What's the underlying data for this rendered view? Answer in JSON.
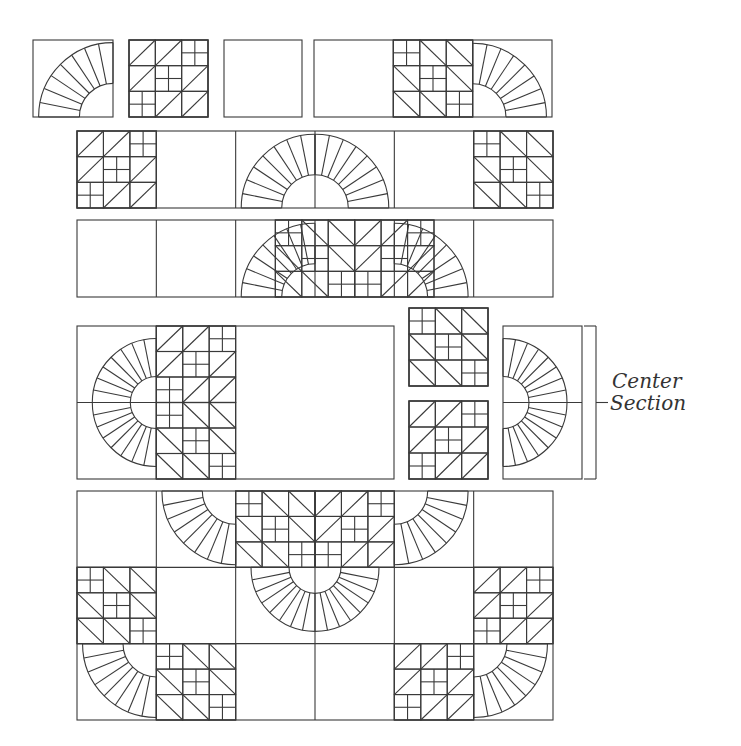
{
  "diagram": {
    "type": "quilt-assembly",
    "stroke_color": "#3a3a3a",
    "label": {
      "line1": "Center",
      "line2": "Section"
    },
    "bracket": {
      "x": 596,
      "y1": 326,
      "y2": 479,
      "tick": 12
    },
    "pieced_pattern": [
      [
        "t",
        "t",
        "f"
      ],
      [
        "t",
        "f",
        "t"
      ],
      [
        "f",
        "t",
        "t"
      ]
    ],
    "rows": [
      {
        "name": "row-1",
        "boxes": [
          {
            "x": 33,
            "y": 40,
            "w": 80,
            "h": 77,
            "cells": [
              {
                "c": 0,
                "type": "fan",
                "corner": "br"
              }
            ],
            "cols": 1
          },
          {
            "x": 129,
            "y": 40,
            "w": 79,
            "h": 77,
            "cells": [
              {
                "c": 0,
                "type": "pieced",
                "flip": false
              }
            ],
            "cols": 1
          },
          {
            "x": 224,
            "y": 40,
            "w": 78,
            "h": 77,
            "cells": [],
            "cols": 1
          },
          {
            "x": 314,
            "y": 40,
            "w": 238,
            "h": 77,
            "cols": 3,
            "cells": [
              {
                "c": 1,
                "type": "pieced",
                "flip": true
              },
              {
                "c": 2,
                "type": "fan",
                "corner": "bl"
              }
            ]
          }
        ]
      },
      {
        "name": "row-2",
        "boxes": [
          {
            "x": 77,
            "y": 131,
            "w": 476,
            "h": 77,
            "cols": 6,
            "cells": [
              {
                "c": 0,
                "type": "pieced",
                "flip": false
              },
              {
                "c": 2,
                "type": "fan",
                "corner": "br"
              },
              {
                "c": 3,
                "type": "fan",
                "corner": "bl"
              },
              {
                "c": 5,
                "type": "pieced",
                "flip": true
              }
            ]
          }
        ]
      },
      {
        "name": "row-3",
        "boxes": [
          {
            "x": 77,
            "y": 220,
            "w": 476,
            "h": 77,
            "cols": 6,
            "cells": [
              {
                "c": 2,
                "type": "fan",
                "corner": "br"
              },
              {
                "c": 2,
                "type": "pieced",
                "flip": false,
                "offset": 1
              },
              {
                "c": 3,
                "type": "pieced",
                "flip": true,
                "offset": 0
              },
              {
                "c": 4,
                "type": "fan",
                "corner": "bl"
              }
            ]
          }
        ]
      },
      {
        "name": "center-section",
        "boxes": [
          {
            "x": 77,
            "y": 326,
            "w": 317,
            "h": 153,
            "cols": 1,
            "cells": [],
            "special": "center-main"
          },
          {
            "x": 409,
            "y": 308,
            "w": 79,
            "h": 78,
            "cols": 1,
            "cells": [
              {
                "c": 0,
                "type": "pieced",
                "flip": true
              }
            ]
          },
          {
            "x": 409,
            "y": 401,
            "w": 79,
            "h": 78,
            "cols": 1,
            "cells": [
              {
                "c": 0,
                "type": "pieced",
                "flip": false
              }
            ]
          },
          {
            "x": 503,
            "y": 326,
            "w": 79,
            "h": 153,
            "cols": 1,
            "cells": [],
            "special": "center-right"
          }
        ]
      },
      {
        "name": "bottom-section",
        "boxes": [
          {
            "x": 77,
            "y": 491,
            "w": 476,
            "h": 229,
            "cols": 6,
            "rows": 3,
            "special": "bottom"
          }
        ]
      }
    ]
  }
}
